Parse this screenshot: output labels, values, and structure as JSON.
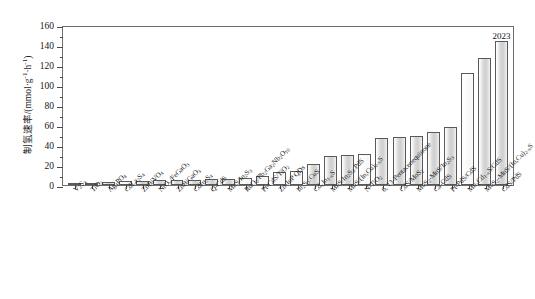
{
  "chart_data": {
    "type": "bar",
    "title": "",
    "xlabel": "",
    "ylabel": "制氢速率/(mmol·g⁻¹·h⁻¹)",
    "ylabel_parts": {
      "prefix": "制氢速率/(mmol·g",
      "sup1": "-1",
      "middle": "·h",
      "sup2": "-1",
      "suffix": ")"
    },
    "ylim": [
      0,
      160
    ],
    "yticks": [
      0,
      20,
      40,
      60,
      80,
      100,
      120,
      140,
      160
    ],
    "ytick_labels": [
      "0",
      "20",
      "40",
      "60",
      "80",
      "100",
      "120",
      "140",
      "160"
    ],
    "minor_ticks": true,
    "grid": false,
    "legend": "none",
    "annotations": [
      {
        "text": "2023",
        "category": "CdS/PdS",
        "value": 144
      }
    ],
    "categories": [
      "V2S3",
      "TiO2",
      "Ag3PO4",
      "CdLa2S4",
      "ZnBiVO4",
      "NiO/FeGaO3",
      "ZnBiGaO3",
      "CdIn2S4",
      "Q-CdS",
      "MnS/In2S3",
      "RuO2/Pb2Ga2Nb2O10",
      "Pt-CdS/TiO2",
      "Zn-InP QDs",
      "In2S3:CuS",
      "CdxIn1-xS",
      "MnS/In2S3:PdS",
      "MnS/(In,Cu)2-xS",
      "N-TiO2",
      "6, 13-Pentacenequinone",
      "CdS/MoS2",
      "MoS2-MnS/In2S3",
      "Ca-CdS",
      "Pt-PdS/CdS",
      "MnxCd1-xS/CdS",
      "MoS2-MnS/(In,Cu)2-xS",
      "CdS/PdS"
    ],
    "categories_rich": [
      {
        "base": "V",
        "parts": [
          [
            "t",
            "V"
          ],
          [
            "sub",
            "2"
          ],
          [
            "t",
            "S"
          ],
          [
            "sub",
            "3"
          ]
        ]
      },
      {
        "parts": [
          [
            "t",
            "TiO"
          ],
          [
            "sub",
            "2"
          ]
        ]
      },
      {
        "parts": [
          [
            "t",
            "Ag"
          ],
          [
            "sub",
            "3"
          ],
          [
            "t",
            "PO"
          ],
          [
            "sub",
            "4"
          ]
        ]
      },
      {
        "parts": [
          [
            "t",
            "CdLa"
          ],
          [
            "sub",
            "2"
          ],
          [
            "t",
            "S"
          ],
          [
            "sub",
            "4"
          ]
        ]
      },
      {
        "parts": [
          [
            "t",
            "ZnBiVO"
          ],
          [
            "sub",
            "4"
          ]
        ]
      },
      {
        "parts": [
          [
            "t",
            "NiO"
          ],
          [
            "sub",
            "x"
          ],
          [
            "t",
            "/FeGaO"
          ],
          [
            "sub",
            "3"
          ]
        ]
      },
      {
        "parts": [
          [
            "t",
            "ZnBiGaO"
          ],
          [
            "sub",
            "3"
          ]
        ]
      },
      {
        "parts": [
          [
            "t",
            "CdIn"
          ],
          [
            "sub",
            "2"
          ],
          [
            "t",
            "S"
          ],
          [
            "sub",
            "4"
          ]
        ]
      },
      {
        "parts": [
          [
            "t",
            "Q-CdS"
          ]
        ]
      },
      {
        "parts": [
          [
            "t",
            "MnS/In"
          ],
          [
            "sub",
            "2"
          ],
          [
            "t",
            "S"
          ],
          [
            "sub",
            "3"
          ]
        ]
      },
      {
        "parts": [
          [
            "t",
            "RuO"
          ],
          [
            "sub",
            "2"
          ],
          [
            "t",
            "/Pb"
          ],
          [
            "sub",
            "2"
          ],
          [
            "t",
            "Ga"
          ],
          [
            "sub",
            "2"
          ],
          [
            "t",
            "Nb"
          ],
          [
            "sub",
            "2"
          ],
          [
            "t",
            "O"
          ],
          [
            "sub",
            "10"
          ]
        ]
      },
      {
        "parts": [
          [
            "t",
            "Pt-CdS/TiO"
          ],
          [
            "sub",
            "2"
          ]
        ]
      },
      {
        "parts": [
          [
            "t",
            "Zn-InP QDs"
          ]
        ]
      },
      {
        "parts": [
          [
            "t",
            "In"
          ],
          [
            "sub",
            "2"
          ],
          [
            "t",
            "S"
          ],
          [
            "sub",
            "3"
          ],
          [
            "t",
            ":CuS"
          ]
        ]
      },
      {
        "parts": [
          [
            "t",
            "Cd"
          ],
          [
            "sub",
            "x"
          ],
          [
            "t",
            "In"
          ],
          [
            "sub",
            "1-x"
          ],
          [
            "t",
            "S"
          ]
        ]
      },
      {
        "parts": [
          [
            "t",
            "MnS/In"
          ],
          [
            "sub",
            "2"
          ],
          [
            "t",
            "S"
          ],
          [
            "sub",
            "3"
          ],
          [
            "t",
            ":PdS"
          ]
        ]
      },
      {
        "parts": [
          [
            "t",
            "MnS/(In,Cu)"
          ],
          [
            "sub",
            "2-x"
          ],
          [
            "t",
            "S"
          ]
        ]
      },
      {
        "parts": [
          [
            "t",
            "N-TiO"
          ],
          [
            "sub",
            "2"
          ]
        ]
      },
      {
        "parts": [
          [
            "t",
            "6, 13-Pentacenequinone"
          ]
        ]
      },
      {
        "parts": [
          [
            "t",
            "CdS/MoS"
          ],
          [
            "sub",
            "2"
          ]
        ]
      },
      {
        "parts": [
          [
            "t",
            "MoS"
          ],
          [
            "sub",
            "2"
          ],
          [
            "t",
            "-MnS/In"
          ],
          [
            "sub",
            "2"
          ],
          [
            "t",
            "S"
          ],
          [
            "sub",
            "3"
          ]
        ]
      },
      {
        "parts": [
          [
            "t",
            "Ca-CdS"
          ]
        ]
      },
      {
        "parts": [
          [
            "t",
            "Pt-PdS/CdS"
          ]
        ]
      },
      {
        "parts": [
          [
            "t",
            "Mn"
          ],
          [
            "sub",
            "x"
          ],
          [
            "t",
            "Cd"
          ],
          [
            "sub",
            "1-x"
          ],
          [
            "t",
            "S/CdS"
          ]
        ]
      },
      {
        "parts": [
          [
            "t",
            "MoS"
          ],
          [
            "sub",
            "2"
          ],
          [
            "t",
            "-MnS/(In,Cu)"
          ],
          [
            "sub",
            "2-x"
          ],
          [
            "t",
            "S"
          ]
        ]
      },
      {
        "parts": [
          [
            "t",
            "CdS/PdS"
          ]
        ]
      }
    ],
    "values": [
      0.6,
      2.0,
      3.5,
      4.0,
      4.5,
      5.0,
      5.2,
      5.5,
      6.0,
      6.5,
      7.0,
      9.0,
      13.0,
      14.0,
      21.0,
      29.0,
      30.0,
      31.0,
      47.0,
      48.0,
      49.0,
      53.0,
      58.0,
      112.0,
      127.0,
      144.0
    ],
    "bar_styles": [
      "shaded",
      "shaded",
      "shaded",
      "light",
      "shaded",
      "shaded",
      "shaded",
      "shaded",
      "shaded",
      "shaded",
      "light",
      "light",
      "light",
      "light",
      "shaded",
      "shaded",
      "shaded",
      "light",
      "shaded",
      "shaded",
      "shaded",
      "shaded",
      "shaded",
      "light",
      "shaded",
      "shaded"
    ]
  }
}
